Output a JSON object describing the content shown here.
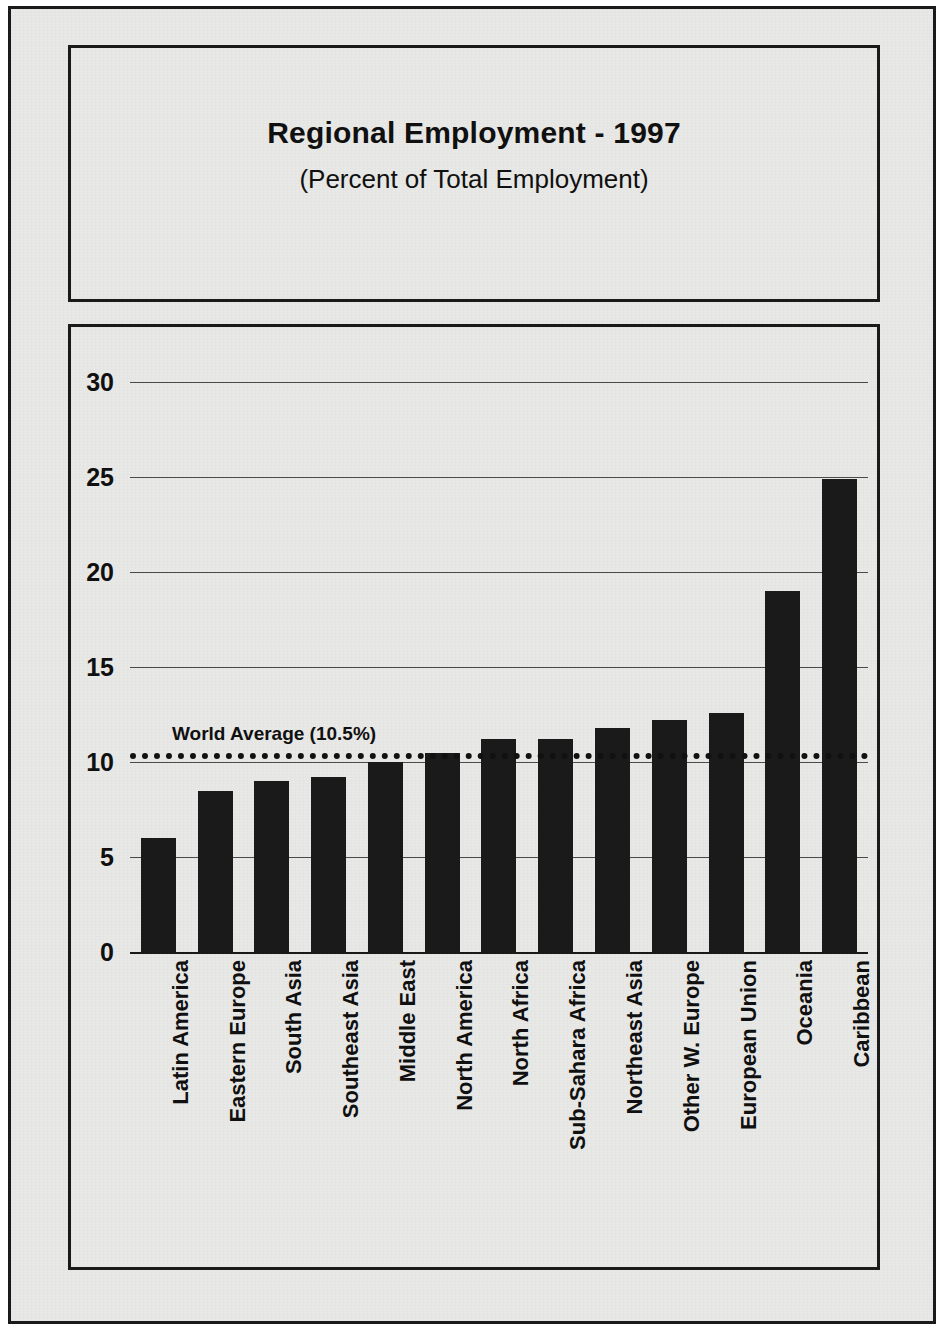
{
  "header": {
    "title": "Regional Employment - 1997",
    "subtitle": "(Percent of Total Employment)"
  },
  "chart_data": {
    "type": "bar",
    "title": "Regional Employment - 1997",
    "subtitle": "(Percent of Total Employment)",
    "xlabel": "",
    "ylabel": "",
    "ylim": [
      0,
      30
    ],
    "yticks": [
      "0",
      "5",
      "10",
      "15",
      "20",
      "25",
      "30"
    ],
    "ytick_values": [
      0,
      5,
      10,
      15,
      20,
      25,
      30
    ],
    "grid": true,
    "legend": "none",
    "bar_color": "#1a1a1a",
    "categories": [
      "Latin America",
      "Eastern Europe",
      "South Asia",
      "Southeast Asia",
      "Middle East",
      "North America",
      "North Africa",
      "Sub-Sahara Africa",
      "Northeast Asia",
      "Other W. Europe",
      "European Union",
      "Oceania",
      "Caribbean"
    ],
    "values": [
      6.0,
      8.5,
      9.0,
      9.2,
      10.0,
      10.5,
      11.2,
      11.2,
      11.8,
      12.2,
      12.6,
      19.0,
      24.9
    ],
    "annotations": [
      {
        "name": "world-average",
        "label": "World Average (10.5%)",
        "value": 10.5,
        "style": "dotted-horizontal-line"
      }
    ]
  }
}
